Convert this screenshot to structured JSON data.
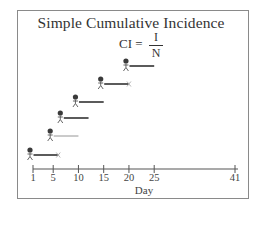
{
  "title": "Simple Cumulative Incidence",
  "formula": {
    "lhs": "CI =",
    "numerator": "I",
    "denominator": "N"
  },
  "axis": {
    "label": "Day",
    "ticks": [
      {
        "value": 1,
        "label": "1"
      },
      {
        "value": 5,
        "label": "5"
      },
      {
        "value": 10,
        "label": "10"
      },
      {
        "value": 15,
        "label": "15"
      },
      {
        "value": 20,
        "label": "20"
      },
      {
        "value": 25,
        "label": "25"
      },
      {
        "value": 41,
        "label": "41"
      }
    ]
  },
  "subjects": [
    {
      "id": 1,
      "start_day": 1,
      "end_day": 6,
      "end_marker": "x",
      "line_style": "thick"
    },
    {
      "id": 2,
      "start_day": 5,
      "end_day": 10,
      "end_marker": "none",
      "line_style": "thin"
    },
    {
      "id": 3,
      "start_day": 7,
      "end_day": 12,
      "end_marker": "none",
      "line_style": "thick"
    },
    {
      "id": 4,
      "start_day": 10,
      "end_day": 15,
      "end_marker": "none",
      "line_style": "thick"
    },
    {
      "id": 5,
      "start_day": 15,
      "end_day": 20,
      "end_marker": "x",
      "line_style": "thick"
    },
    {
      "id": 6,
      "start_day": 20,
      "end_day": 25,
      "end_marker": "none",
      "line_style": "thick"
    }
  ],
  "colors": {
    "ink": "#333333",
    "frame": "#8a8a8a",
    "cross": "#aaaaaa"
  }
}
